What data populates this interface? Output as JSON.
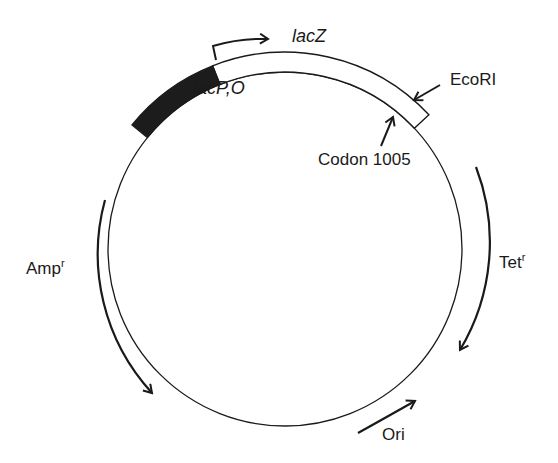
{
  "diagram": {
    "type": "plasmid-map",
    "colors": {
      "line": "#1a1a1a",
      "promoter_fill": "#1c1c1c",
      "background": "#ffffff"
    },
    "labels": {
      "lacZ": "lacZ",
      "lacPO": "lacP,O",
      "ecori": "EcoRI",
      "codon": "Codon 1005",
      "tet": "Tet",
      "tet_sup": "r",
      "amp": "Amp",
      "amp_sup": "r",
      "ori": "Ori"
    },
    "features": [
      {
        "name": "lacP,O",
        "kind": "promoter/operator",
        "style": "filled box"
      },
      {
        "name": "lacZ",
        "kind": "gene",
        "style": "open box",
        "direction": "clockwise"
      },
      {
        "name": "EcoRI",
        "kind": "restriction site"
      },
      {
        "name": "Codon 1005",
        "kind": "position marker"
      },
      {
        "name": "Tetr",
        "kind": "resistance gene",
        "direction": "clockwise"
      },
      {
        "name": "Ori",
        "kind": "origin of replication",
        "direction": "counter-clockwise"
      },
      {
        "name": "Ampr",
        "kind": "resistance gene",
        "direction": "counter-clockwise"
      }
    ]
  }
}
